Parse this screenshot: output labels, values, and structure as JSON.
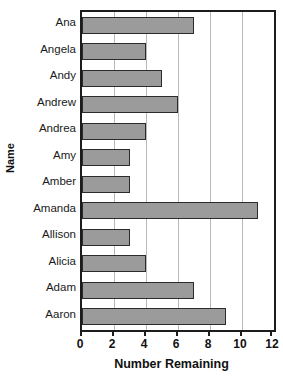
{
  "chart_data": {
    "type": "bar",
    "orientation": "horizontal",
    "title": "",
    "xlabel": "Number Remaining",
    "ylabel": "Name",
    "categories": [
      "Ana",
      "Angela",
      "Andy",
      "Andrew",
      "Andrea",
      "Amy",
      "Amber",
      "Amanda",
      "Allison",
      "Alicia",
      "Adam",
      "Aaron"
    ],
    "values": [
      7,
      4,
      5,
      6,
      4,
      3,
      3,
      11,
      3,
      4,
      7,
      9
    ],
    "xlim": [
      0,
      12
    ],
    "xticks": [
      0,
      2,
      4,
      6,
      8,
      10,
      12
    ],
    "xtick_labels": [
      "0",
      "2",
      "4",
      "6",
      "8",
      "10",
      "12"
    ],
    "gridlines": [
      2,
      4,
      6,
      8,
      10
    ],
    "grid": true,
    "legend": false,
    "bar_color": "#9b9b9b",
    "bar_border_color": "#2b2b2b",
    "grid_color": "#b9b9b9",
    "axis_color": "#1c1c1c"
  }
}
